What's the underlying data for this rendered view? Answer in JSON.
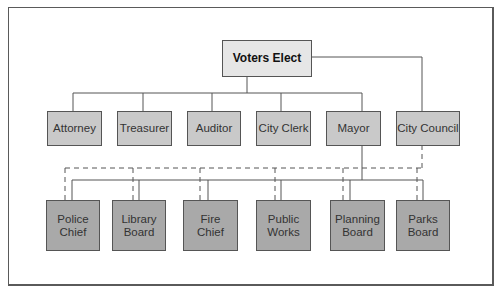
{
  "diagram": {
    "type": "org-chart",
    "top": {
      "label": "Voters Elect"
    },
    "elected": [
      {
        "label": "Attorney"
      },
      {
        "label": "Treasurer"
      },
      {
        "label": "Auditor"
      },
      {
        "label": "City Clerk"
      },
      {
        "label": "Mayor"
      },
      {
        "label": "City Council"
      }
    ],
    "appointed": [
      {
        "label": "Police\nChief"
      },
      {
        "label": "Library\nBoard"
      },
      {
        "label": "Fire\nChief"
      },
      {
        "label": "Public\nWorks"
      },
      {
        "label": "Planning\nBoard"
      },
      {
        "label": "Parks\nBoard"
      }
    ],
    "connections": {
      "solid": "Mayor appoints department heads and boards",
      "dashed": "City Council oversight of department heads and boards"
    },
    "colors": {
      "top_fill": "#e6e6e6",
      "elected_fill": "#c9c9c9",
      "appointed_fill": "#a9a9a9",
      "line": "#555555"
    }
  }
}
